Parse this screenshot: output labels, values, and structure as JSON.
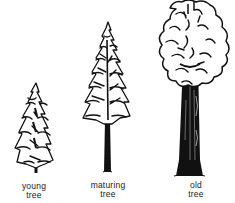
{
  "figure": {
    "colors": {
      "ink": "#111111",
      "paper": "#ffffff"
    },
    "trees": [
      {
        "id": "young",
        "label_line1": "young",
        "label_line2": "tree"
      },
      {
        "id": "maturing",
        "label_line1": "maturing",
        "label_line2": "tree"
      },
      {
        "id": "old",
        "label_line1": "old",
        "label_line2": "tree"
      }
    ]
  }
}
